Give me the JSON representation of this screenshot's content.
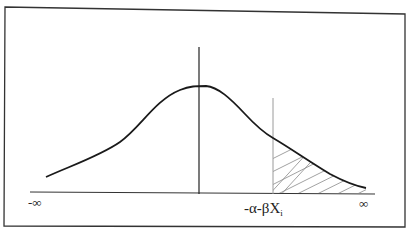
{
  "diagram": {
    "type": "probability-density-curve",
    "axis": {
      "left_label": "-∞",
      "right_label": "∞",
      "threshold_label_prefix": "-α-βX",
      "threshold_label_subscript": "i"
    },
    "colors": {
      "frame": "#333333",
      "curve": "#1a1a1a",
      "axis": "#333333",
      "threshold_line": "#9a9a9a",
      "hatch": "#8a8a8a"
    }
  }
}
